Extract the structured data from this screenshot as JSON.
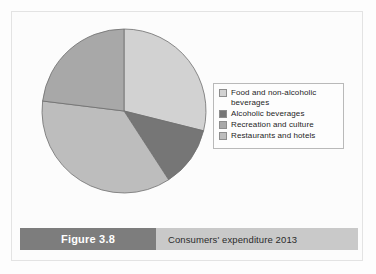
{
  "figure": {
    "number_label": "Figure 3.8",
    "caption": "Consumers' expenditure 2013"
  },
  "colors": {
    "slice_food": "#d2d2d2",
    "slice_alcoholic": "#767676",
    "slice_recreation": "#a8a8a8",
    "slice_restaurants": "#bdbdbd",
    "slice_outline": "#6e6e6e",
    "legend_border": "#b9b9b9",
    "caption_number_bg": "#7d7d7d",
    "caption_title_bg": "#c9c9c9",
    "caption_number_text": "#ffffff",
    "caption_title_text": "#2b2b2b"
  },
  "legend": {
    "items": [
      {
        "label": "Food and non-alcoholic\nbeverages",
        "color": "#d2d2d2",
        "swatch_name": "legend-swatch-food"
      },
      {
        "label": "Alcoholic beverages",
        "color": "#767676",
        "swatch_name": "legend-swatch-alcoholic"
      },
      {
        "label": "Recreation and culture",
        "color": "#a8a8a8",
        "swatch_name": "legend-swatch-recreation"
      },
      {
        "label": "Restaurants and hotels",
        "color": "#bdbdbd",
        "swatch_name": "legend-swatch-restaurants"
      }
    ]
  },
  "chart_data": {
    "type": "pie",
    "title": "Consumers' expenditure 2013",
    "subtitle": "",
    "xlabel": "",
    "ylabel": "",
    "legend_position": "right",
    "grid": false,
    "start_angle_deg": 0,
    "direction": "clockwise",
    "categories": [
      "Food and non-alcoholic beverages",
      "Alcoholic beverages",
      "Restaurants and hotels",
      "Recreation and culture"
    ],
    "values": [
      29,
      12,
      36,
      23
    ],
    "units": "percent",
    "slices": [
      {
        "label": "Food and non-alcoholic beverages",
        "value": 29,
        "color": "#d2d2d2",
        "start_deg": 0,
        "end_deg": 104
      },
      {
        "label": "Alcoholic beverages",
        "value": 12,
        "color": "#767676",
        "start_deg": 104,
        "end_deg": 147
      },
      {
        "label": "Restaurants and hotels",
        "value": 36,
        "color": "#bdbdbd",
        "start_deg": 147,
        "end_deg": 277
      },
      {
        "label": "Recreation and culture",
        "value": 23,
        "color": "#a8a8a8",
        "start_deg": 277,
        "end_deg": 360
      }
    ]
  }
}
